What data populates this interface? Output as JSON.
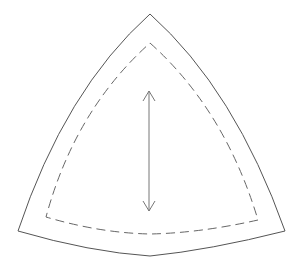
{
  "diagram": {
    "type": "sewing-pattern-piece",
    "shape": "curved-triangle",
    "background": "#ffffff",
    "stroke_color": "#555555",
    "elements": {
      "cutting_line": {
        "label": "",
        "style": "solid"
      },
      "seam_line": {
        "label": "",
        "style": "dashed"
      },
      "grainline": {
        "label": "",
        "style": "double-headed-arrow"
      }
    }
  }
}
